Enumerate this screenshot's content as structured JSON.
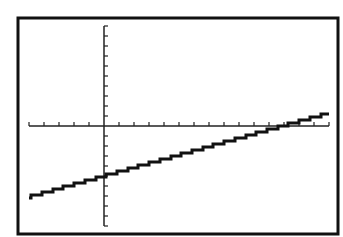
{
  "screen": {
    "frame": {
      "left": 18,
      "top": 18,
      "right": 338,
      "bottom": 234,
      "color": "#111111"
    },
    "background": "#ffffff"
  },
  "chart_data": {
    "type": "line",
    "title": "",
    "xlabel": "",
    "ylabel": "",
    "xlim": [
      -5,
      15
    ],
    "ylim": [
      -10,
      10
    ],
    "xscl": 1,
    "yscl": 1,
    "grid": false,
    "legend": null,
    "style": "graphing-calculator pixel plot with tick marks, no labels",
    "series": [
      {
        "name": "Y1",
        "equation_estimate": "y ≈ 0.42x − 5",
        "x": [
          -5,
          0,
          5,
          10,
          11.9,
          15
        ],
        "values": [
          -7.1,
          -5.0,
          -2.9,
          -0.8,
          0.0,
          1.3
        ]
      }
    ],
    "annotations": []
  },
  "pixel_map": {
    "origin_x": 104,
    "origin_y": 126,
    "px_per_x_unit": 15,
    "px_per_y_unit": 10
  },
  "colors": {
    "axis": "#222222",
    "line": "#111111",
    "frame": "#111111"
  }
}
